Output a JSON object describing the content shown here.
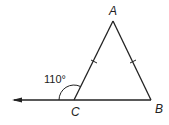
{
  "diagram": {
    "type": "triangle",
    "vertices": {
      "A": "A",
      "B": "B",
      "C": "C"
    },
    "angle_label": "110°",
    "colors": {
      "stroke": "#222222",
      "background": "#ffffff"
    }
  }
}
